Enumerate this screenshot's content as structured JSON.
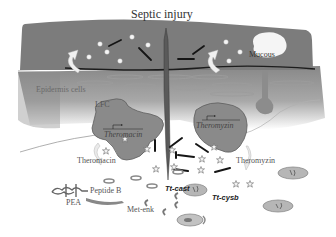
{
  "diagram": {
    "title": "Septic injury",
    "labels": {
      "mucous": "Mucous",
      "epidermis": "Epidermis cells",
      "lfc": "LFC",
      "theromacin_gene": "Theromacin",
      "theromyzin_gene": "Theromyzin",
      "theromacin_peptide": "Theromacin",
      "theromyzin_peptide": "Theromyzin",
      "peptide_b": "Peptide B",
      "pea": "PEA",
      "met_enk": "Met-enk",
      "tt_cast": "Tt-cast",
      "tt_cysb": "Tt-cysb"
    },
    "colors": {
      "outer_layer": "#7a7a7a",
      "epidermis_gradient_top": "#8a8a8a",
      "epidermis_gradient_bottom": "#ffffff",
      "cell_fill": "#8c8c8c",
      "cell_stroke": "#5a5a5a",
      "bacteria": "#1a1a1a",
      "mucous": "#f4f4f4",
      "background": "#ffffff"
    }
  }
}
